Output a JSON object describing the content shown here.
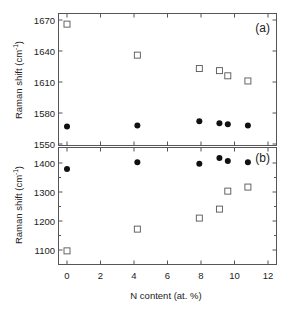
{
  "chart_data": [
    {
      "type": "scatter",
      "panel": "(a)",
      "xlabel": "N content (at. %)",
      "ylabel": "Raman shift (cm⁻¹)",
      "xlim": [
        -0.5,
        12.5
      ],
      "ylim": [
        1550,
        1677
      ],
      "xticks": [
        0,
        2,
        4,
        6,
        8,
        10,
        12
      ],
      "yticks": [
        1550,
        1580,
        1610,
        1640,
        1670
      ],
      "ytick_labels": [
        "1550",
        "1580",
        "1610",
        "1640",
        "1670"
      ],
      "grid": false,
      "series": [
        {
          "name": "open squares",
          "marker": "square-open",
          "x": [
            0,
            4.2,
            7.9,
            9.1,
            9.6,
            10.8
          ],
          "y": [
            1666,
            1636,
            1623,
            1621,
            1616,
            1611
          ]
        },
        {
          "name": "filled circles",
          "marker": "circle-filled",
          "x": [
            0,
            4.2,
            7.9,
            9.1,
            9.6,
            10.8
          ],
          "y": [
            1567,
            1568,
            1572,
            1570,
            1569,
            1568
          ]
        }
      ]
    },
    {
      "type": "scatter",
      "panel": "(b)",
      "xlabel": "N content (at. %)",
      "ylabel": "Raman shift (cm⁻¹)",
      "xlim": [
        -0.5,
        12.5
      ],
      "ylim": [
        1052,
        1455
      ],
      "xticks": [
        0,
        2,
        4,
        6,
        8,
        10,
        12
      ],
      "xtick_labels": [
        "0",
        "2",
        "4",
        "6",
        "8",
        "10",
        "12"
      ],
      "yticks": [
        1100,
        1200,
        1300,
        1400
      ],
      "ytick_labels": [
        "1100",
        "1200",
        "1300",
        "1400"
      ],
      "grid": false,
      "series": [
        {
          "name": "filled circles",
          "marker": "circle-filled",
          "x": [
            0,
            4.2,
            7.9,
            9.1,
            9.6,
            10.8
          ],
          "y": [
            1379,
            1403,
            1397,
            1417,
            1407,
            1403
          ]
        },
        {
          "name": "open squares",
          "marker": "square-open",
          "x": [
            0,
            4.2,
            7.9,
            9.1,
            9.6,
            10.8
          ],
          "y": [
            1097,
            1172,
            1210,
            1241,
            1303,
            1317
          ]
        }
      ]
    }
  ],
  "labels": {
    "ylabel_top": "Raman shift (cm",
    "ylabel_bottom": "Raman shift (cm",
    "ylabel_sup": "-1",
    "ylabel_close": ")",
    "xlabel": "N content (at. %)",
    "panel_a": "(a)",
    "panel_b": "(b)"
  }
}
